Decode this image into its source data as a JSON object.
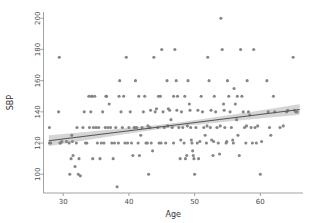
{
  "chart_data": {
    "type": "scatter",
    "title": "",
    "xlabel": "Age",
    "ylabel": "SBP",
    "xlim": [
      27.0,
      66.5
    ],
    "ylim": [
      88,
      204
    ],
    "xticks": [
      30,
      40,
      50,
      60
    ],
    "ytick_labels": [
      "100",
      "120",
      "140",
      "160",
      "180",
      "200"
    ],
    "yticks": [
      100,
      120,
      140,
      160,
      180,
      200
    ],
    "grid": false,
    "legend": null,
    "marker_color": "#808080",
    "line_color": "#555555",
    "band_color": "#b3b3b3",
    "regression": {
      "type": "linear-fit-with-confidence-band",
      "x_start": 27.8,
      "x_end": 66.0,
      "y_start": 121.5,
      "y_end": 141.5,
      "slope": 0.523,
      "intercept": 107.0,
      "band_halfwidth_start": 3.6,
      "band_halfwidth_mid": 1.3,
      "band_halfwidth_end": 3.4,
      "band_narrowest_x": 46.5
    },
    "points": [
      [
        27.9,
        130
      ],
      [
        27.9,
        120
      ],
      [
        28.1,
        120
      ],
      [
        29.3,
        140
      ],
      [
        29.4,
        175
      ],
      [
        29.5,
        120
      ],
      [
        29.6,
        120
      ],
      [
        30.9,
        120
      ],
      [
        31.0,
        100
      ],
      [
        31.2,
        110
      ],
      [
        31.3,
        125
      ],
      [
        31.4,
        121
      ],
      [
        31.5,
        112
      ],
      [
        31.8,
        105
      ],
      [
        32.0,
        120
      ],
      [
        32.1,
        130
      ],
      [
        32.3,
        100
      ],
      [
        32.4,
        110
      ],
      [
        32.6,
        99
      ],
      [
        33.0,
        130
      ],
      [
        33.2,
        140
      ],
      [
        33.6,
        120
      ],
      [
        33.9,
        150
      ],
      [
        34.0,
        130
      ],
      [
        34.2,
        140
      ],
      [
        34.3,
        150
      ],
      [
        34.5,
        110
      ],
      [
        34.8,
        150
      ],
      [
        35.0,
        130
      ],
      [
        35.2,
        120
      ],
      [
        35.4,
        130
      ],
      [
        35.6,
        110
      ],
      [
        36.0,
        140
      ],
      [
        36.2,
        120
      ],
      [
        36.4,
        130
      ],
      [
        36.6,
        150
      ],
      [
        37.0,
        145
      ],
      [
        37.2,
        130
      ],
      [
        37.4,
        120
      ],
      [
        37.6,
        110
      ],
      [
        38.0,
        130
      ],
      [
        38.2,
        92
      ],
      [
        38.4,
        120
      ],
      [
        38.6,
        160
      ],
      [
        38.8,
        140
      ],
      [
        39.0,
        130
      ],
      [
        39.2,
        150
      ],
      [
        39.4,
        120
      ],
      [
        39.6,
        175
      ],
      [
        40.0,
        130
      ],
      [
        40.2,
        140
      ],
      [
        40.4,
        120
      ],
      [
        40.6,
        112
      ],
      [
        40.8,
        130
      ],
      [
        41.0,
        160
      ],
      [
        41.2,
        130
      ],
      [
        41.4,
        120
      ],
      [
        41.6,
        112
      ],
      [
        41.8,
        125
      ],
      [
        42.0,
        130
      ],
      [
        42.2,
        140
      ],
      [
        42.4,
        150
      ],
      [
        42.6,
        120
      ],
      [
        43.0,
        100
      ],
      [
        43.2,
        130
      ],
      [
        43.4,
        120
      ],
      [
        43.6,
        115
      ],
      [
        43.8,
        175
      ],
      [
        44.0,
        140
      ],
      [
        44.2,
        142
      ],
      [
        44.4,
        130
      ],
      [
        44.6,
        120
      ],
      [
        44.8,
        150
      ],
      [
        45.0,
        180
      ],
      [
        45.2,
        140
      ],
      [
        45.4,
        130
      ],
      [
        45.6,
        120
      ],
      [
        45.8,
        160
      ],
      [
        46.0,
        142
      ],
      [
        46.2,
        141
      ],
      [
        46.4,
        135
      ],
      [
        46.6,
        130
      ],
      [
        46.8,
        120
      ],
      [
        47.0,
        180
      ],
      [
        47.2,
        160
      ],
      [
        47.4,
        150
      ],
      [
        47.6,
        130
      ],
      [
        47.8,
        110
      ],
      [
        48.0,
        140
      ],
      [
        48.2,
        130
      ],
      [
        48.4,
        120
      ],
      [
        48.6,
        110
      ],
      [
        48.8,
        112
      ],
      [
        49.0,
        160
      ],
      [
        49.2,
        145
      ],
      [
        49.4,
        130
      ],
      [
        49.5,
        122
      ],
      [
        49.6,
        120
      ],
      [
        49.7,
        115
      ],
      [
        49.8,
        112
      ],
      [
        49.9,
        110
      ],
      [
        50.0,
        100
      ],
      [
        50.2,
        130
      ],
      [
        50.4,
        120
      ],
      [
        50.6,
        110
      ],
      [
        51.0,
        150
      ],
      [
        51.2,
        140
      ],
      [
        51.4,
        130
      ],
      [
        51.6,
        125
      ],
      [
        51.8,
        120
      ],
      [
        52.0,
        175
      ],
      [
        52.2,
        160
      ],
      [
        52.4,
        130
      ],
      [
        52.6,
        122
      ],
      [
        52.8,
        112
      ],
      [
        53.0,
        150
      ],
      [
        53.2,
        140
      ],
      [
        53.4,
        130
      ],
      [
        53.6,
        120
      ],
      [
        53.8,
        113
      ],
      [
        54.0,
        200
      ],
      [
        54.2,
        180
      ],
      [
        54.4,
        145
      ],
      [
        54.6,
        130
      ],
      [
        54.8,
        120
      ],
      [
        55.0,
        160
      ],
      [
        55.2,
        150
      ],
      [
        55.4,
        140
      ],
      [
        55.6,
        130
      ],
      [
        55.8,
        122
      ],
      [
        55.9,
        120
      ],
      [
        56.0,
        155
      ],
      [
        56.2,
        145
      ],
      [
        56.4,
        135
      ],
      [
        56.6,
        125
      ],
      [
        56.8,
        112
      ],
      [
        57.0,
        180
      ],
      [
        57.2,
        150
      ],
      [
        57.4,
        140
      ],
      [
        57.6,
        130
      ],
      [
        57.8,
        120
      ],
      [
        58.0,
        160
      ],
      [
        58.2,
        140
      ],
      [
        58.4,
        138
      ],
      [
        58.6,
        130
      ],
      [
        58.8,
        120
      ],
      [
        59.0,
        180
      ],
      [
        59.2,
        130
      ],
      [
        59.4,
        120
      ],
      [
        60.0,
        100
      ],
      [
        60.2,
        121
      ],
      [
        61.0,
        160
      ],
      [
        61.2,
        140
      ],
      [
        61.4,
        130
      ],
      [
        61.6,
        125
      ],
      [
        62.0,
        150
      ],
      [
        62.2,
        140
      ],
      [
        63.0,
        130
      ],
      [
        64.0,
        140
      ],
      [
        64.2,
        141
      ],
      [
        65.0,
        175
      ],
      [
        65.2,
        141
      ],
      [
        65.4,
        140
      ],
      [
        65.6,
        140
      ],
      [
        33.4,
        120
      ],
      [
        35.8,
        120
      ],
      [
        37.8,
        120
      ],
      [
        39.8,
        120
      ],
      [
        42.8,
        120
      ],
      [
        44.9,
        120
      ],
      [
        47.9,
        122
      ],
      [
        50.8,
        121
      ],
      [
        52.9,
        121
      ],
      [
        54.9,
        121
      ],
      [
        34.6,
        130
      ],
      [
        36.8,
        130
      ],
      [
        40.9,
        130
      ],
      [
        42.9,
        131
      ],
      [
        45.9,
        131
      ],
      [
        48.9,
        131
      ],
      [
        51.9,
        131
      ],
      [
        53.9,
        131
      ],
      [
        57.9,
        131
      ],
      [
        59.6,
        131
      ],
      [
        63.5,
        131
      ],
      [
        30.5,
        121
      ],
      [
        29.8,
        121
      ],
      [
        49.3,
        141
      ],
      [
        47.3,
        141
      ],
      [
        43.3,
        141
      ],
      [
        50.5,
        141
      ],
      [
        52.5,
        141
      ],
      [
        54.5,
        141
      ],
      [
        56.5,
        150
      ],
      [
        48.5,
        150
      ],
      [
        46.8,
        150
      ],
      [
        44.5,
        150
      ],
      [
        41.5,
        150
      ],
      [
        38.5,
        150
      ],
      [
        36.5,
        150
      ],
      [
        34.4,
        150
      ]
    ]
  },
  "axis": {
    "x_title": "Age",
    "y_title": "SBP"
  }
}
